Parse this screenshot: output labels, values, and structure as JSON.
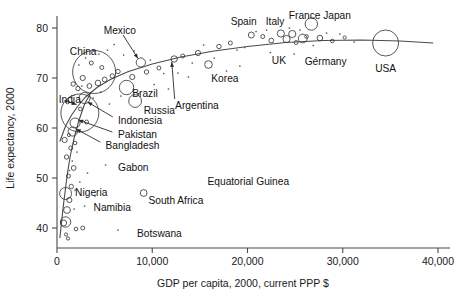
{
  "chart_data": {
    "type": "scatter",
    "title": "",
    "xlabel": "GDP per capita, 2000, current PPP $",
    "ylabel": "Life expectancy, 2000",
    "xlim": [
      0,
      40000
    ],
    "ylim": [
      36,
      83
    ],
    "grid": false,
    "legend": "none",
    "bubble_encoding": "population",
    "xticks": [
      {
        "value": 0,
        "label": "0"
      },
      {
        "value": 10000,
        "label": "10,000"
      },
      {
        "value": 20000,
        "label": "20,000"
      },
      {
        "value": 30000,
        "label": "30,000"
      },
      {
        "value": 40000,
        "label": "40,000"
      }
    ],
    "yticks": [
      {
        "value": 40,
        "label": "40"
      },
      {
        "value": 50,
        "label": "50"
      },
      {
        "value": 60,
        "label": "60"
      },
      {
        "value": 70,
        "label": "70"
      },
      {
        "value": 80,
        "label": "80"
      }
    ],
    "annotations": [
      {
        "name": "China",
        "x": 3900,
        "y": 71.2,
        "label_x": 1350,
        "label_y": 75.4,
        "anchor": "start",
        "leader": false
      },
      {
        "name": "India",
        "x": 2400,
        "y": 63.0,
        "label_x": 180,
        "label_y": 65.8,
        "anchor": "start",
        "leader": true,
        "leader_to_x": 2050,
        "leader_to_y": 64.7
      },
      {
        "name": "Mexico",
        "x": 8800,
        "y": 73.1,
        "label_x": 6600,
        "label_y": 79.6,
        "anchor": "middle",
        "leader": true,
        "leader_to_x": 8500,
        "leader_to_y": 73.9
      },
      {
        "name": "Brazil",
        "x": 7300,
        "y": 68.1,
        "label_x": 7900,
        "label_y": 67.0,
        "anchor": "start",
        "leader": false
      },
      {
        "name": "Russia",
        "x": 8200,
        "y": 65.4,
        "label_x": 9100,
        "label_y": 63.6,
        "anchor": "start",
        "leader": false
      },
      {
        "name": "Indonesia",
        "x": 2900,
        "y": 66.0,
        "label_x": 6400,
        "label_y": 61.6,
        "anchor": "start",
        "leader": true,
        "leader_to_x": 3200,
        "leader_to_y": 65.2
      },
      {
        "name": "Pakistan",
        "x": 1900,
        "y": 61.0,
        "label_x": 6400,
        "label_y": 58.8,
        "anchor": "start",
        "leader": true,
        "leader_to_x": 2250,
        "leader_to_y": 61.6
      },
      {
        "name": "Bangladesh",
        "x": 1650,
        "y": 59.3,
        "label_x": 5100,
        "label_y": 56.6,
        "anchor": "start",
        "leader": true,
        "leader_to_x": 2000,
        "leader_to_y": 59.8
      },
      {
        "name": "Argentina",
        "x": 12300,
        "y": 73.8,
        "label_x": 12400,
        "label_y": 64.6,
        "anchor": "start",
        "leader": true,
        "leader_to_x": 12050,
        "leader_to_y": 73.2
      },
      {
        "name": "Korea",
        "x": 15900,
        "y": 72.7,
        "label_x": 16200,
        "label_y": 70.0,
        "anchor": "start",
        "leader": false
      },
      {
        "name": "Spain",
        "x": 20400,
        "y": 78.6,
        "label_x": 19600,
        "label_y": 81.4,
        "anchor": "middle",
        "leader": false
      },
      {
        "name": "Italy",
        "x": 23500,
        "y": 78.9,
        "label_x": 22900,
        "label_y": 81.4,
        "anchor": "middle",
        "leader": false
      },
      {
        "name": "France",
        "x": 24700,
        "y": 78.8,
        "label_x": 26000,
        "label_y": 82.6,
        "anchor": "middle",
        "leader": false
      },
      {
        "name": "Japan",
        "x": 26700,
        "y": 80.8,
        "label_x": 29400,
        "label_y": 82.6,
        "anchor": "middle",
        "leader": false
      },
      {
        "name": "UK",
        "x": 24100,
        "y": 77.8,
        "label_x": 23300,
        "label_y": 73.6,
        "anchor": "middle",
        "leader": false
      },
      {
        "name": "Germany",
        "x": 25800,
        "y": 77.9,
        "label_x": 28200,
        "label_y": 73.3,
        "anchor": "middle",
        "leader": false
      },
      {
        "name": "USA",
        "x": 34500,
        "y": 77.0,
        "label_x": 34500,
        "label_y": 72.0,
        "anchor": "middle",
        "leader": false
      },
      {
        "name": "Gabon",
        "x": 5800,
        "y": 52.6,
        "label_x": 6400,
        "label_y": 52.2,
        "anchor": "start",
        "leader": false
      },
      {
        "name": "Nigeria",
        "x": 900,
        "y": 46.9,
        "label_x": 1900,
        "label_y": 47.1,
        "anchor": "start",
        "leader": false
      },
      {
        "name": "Namibia",
        "x": 6200,
        "y": 46.0,
        "label_x": 5800,
        "label_y": 44.1,
        "anchor": "middle",
        "leader": false
      },
      {
        "name": "South Africa",
        "x": 9100,
        "y": 47.0,
        "label_x": 9600,
        "label_y": 45.6,
        "anchor": "start",
        "leader": false
      },
      {
        "name": "Equatorial Guinea",
        "x": 15200,
        "y": 49.5,
        "label_x": 15800,
        "label_y": 49.3,
        "anchor": "start",
        "leader": false
      },
      {
        "name": "Botswana",
        "x": 7700,
        "y": 39.4,
        "label_x": 8400,
        "label_y": 38.9,
        "anchor": "start",
        "leader": false
      }
    ],
    "labeled_bubbles": [
      {
        "name": "China",
        "x": 3900,
        "y": 71.2,
        "r": 21.5
      },
      {
        "name": "India",
        "x": 2400,
        "y": 63.0,
        "r": 19.0
      },
      {
        "name": "Mexico",
        "x": 8800,
        "y": 73.1,
        "r": 4.6
      },
      {
        "name": "Brazil",
        "x": 7300,
        "y": 68.1,
        "r": 7.2
      },
      {
        "name": "Russia",
        "x": 8200,
        "y": 65.4,
        "r": 6.4
      },
      {
        "name": "Indonesia",
        "x": 2900,
        "y": 66.0,
        "r": 5.6
      },
      {
        "name": "Pakistan",
        "x": 1900,
        "y": 61.0,
        "r": 5.0
      },
      {
        "name": "Bangladesh",
        "x": 1650,
        "y": 59.3,
        "r": 4.6
      },
      {
        "name": "Japan",
        "x": 26700,
        "y": 80.8,
        "r": 6.2
      },
      {
        "name": "USA",
        "x": 34500,
        "y": 77.0,
        "r": 13.0
      },
      {
        "name": "Germany",
        "x": 25800,
        "y": 77.9,
        "r": 4.4
      },
      {
        "name": "UK",
        "x": 24100,
        "y": 77.8,
        "r": 3.6
      },
      {
        "name": "France",
        "x": 24700,
        "y": 78.8,
        "r": 3.6
      },
      {
        "name": "Italy",
        "x": 23500,
        "y": 78.9,
        "r": 3.6
      },
      {
        "name": "Spain",
        "x": 20400,
        "y": 78.6,
        "r": 3.0
      },
      {
        "name": "Korea",
        "x": 15900,
        "y": 72.7,
        "r": 3.8
      },
      {
        "name": "Argentina",
        "x": 12300,
        "y": 73.8,
        "r": 3.2
      },
      {
        "name": "South Africa",
        "x": 9100,
        "y": 47.0,
        "r": 3.4
      },
      {
        "name": "Nigeria",
        "x": 900,
        "y": 46.9,
        "r": 6.0
      }
    ],
    "other_bubbles": [
      {
        "x": 900,
        "y": 41.2,
        "r": 5.2
      },
      {
        "x": 1050,
        "y": 43.6,
        "r": 3.4
      },
      {
        "x": 1300,
        "y": 45.6,
        "r": 2.6
      },
      {
        "x": 700,
        "y": 41.0,
        "r": 3.0
      },
      {
        "x": 1500,
        "y": 48.3,
        "r": 2.2
      },
      {
        "x": 1200,
        "y": 50.4,
        "r": 2.0
      },
      {
        "x": 1750,
        "y": 52.0,
        "r": 2.4
      },
      {
        "x": 1000,
        "y": 54.2,
        "r": 2.2
      },
      {
        "x": 1450,
        "y": 56.0,
        "r": 2.0
      },
      {
        "x": 800,
        "y": 57.6,
        "r": 2.6
      },
      {
        "x": 1900,
        "y": 57.0,
        "r": 1.8
      },
      {
        "x": 1250,
        "y": 58.6,
        "r": 1.6
      },
      {
        "x": 3100,
        "y": 61.2,
        "r": 2.0
      },
      {
        "x": 2200,
        "y": 67.9,
        "r": 2.2
      },
      {
        "x": 3400,
        "y": 68.4,
        "r": 2.4
      },
      {
        "x": 4300,
        "y": 69.0,
        "r": 2.8
      },
      {
        "x": 5000,
        "y": 69.7,
        "r": 2.4
      },
      {
        "x": 5800,
        "y": 70.4,
        "r": 2.2
      },
      {
        "x": 4700,
        "y": 72.1,
        "r": 2.0
      },
      {
        "x": 6400,
        "y": 71.3,
        "r": 2.2
      },
      {
        "x": 3600,
        "y": 73.0,
        "r": 2.0
      },
      {
        "x": 2700,
        "y": 70.0,
        "r": 2.6
      },
      {
        "x": 1700,
        "y": 68.8,
        "r": 2.2
      },
      {
        "x": 1100,
        "y": 65.2,
        "r": 1.8
      },
      {
        "x": 2450,
        "y": 63.8,
        "r": 1.8
      },
      {
        "x": 7900,
        "y": 70.2,
        "r": 2.6
      },
      {
        "x": 9400,
        "y": 71.2,
        "r": 2.2
      },
      {
        "x": 10700,
        "y": 72.0,
        "r": 2.0
      },
      {
        "x": 13200,
        "y": 74.4,
        "r": 2.0
      },
      {
        "x": 14800,
        "y": 75.0,
        "r": 2.6
      },
      {
        "x": 18200,
        "y": 77.0,
        "r": 2.0
      },
      {
        "x": 17000,
        "y": 76.3,
        "r": 2.2
      },
      {
        "x": 21600,
        "y": 78.3,
        "r": 2.0
      },
      {
        "x": 22500,
        "y": 77.5,
        "r": 2.4
      },
      {
        "x": 25100,
        "y": 77.1,
        "r": 2.0
      },
      {
        "x": 26200,
        "y": 78.3,
        "r": 1.8
      },
      {
        "x": 27600,
        "y": 78.0,
        "r": 2.8
      },
      {
        "x": 28900,
        "y": 77.4,
        "r": 1.8
      },
      {
        "x": 30200,
        "y": 78.1,
        "r": 1.6
      },
      {
        "x": 2000,
        "y": 39.8,
        "r": 1.8
      },
      {
        "x": 2700,
        "y": 40.0,
        "r": 2.0
      },
      {
        "x": 950,
        "y": 38.7,
        "r": 1.6
      },
      {
        "x": 1150,
        "y": 37.9,
        "r": 1.6
      }
    ],
    "dot_points": [
      {
        "x": 6000,
        "y": 76.7
      },
      {
        "x": 5300,
        "y": 75.6
      },
      {
        "x": 4400,
        "y": 74.8
      },
      {
        "x": 3000,
        "y": 74.0
      },
      {
        "x": 2300,
        "y": 72.6
      },
      {
        "x": 7000,
        "y": 74.6
      },
      {
        "x": 8100,
        "y": 75.4
      },
      {
        "x": 9800,
        "y": 73.6
      },
      {
        "x": 11200,
        "y": 70.9
      },
      {
        "x": 12700,
        "y": 71.0
      },
      {
        "x": 15400,
        "y": 76.6
      },
      {
        "x": 16500,
        "y": 74.0
      },
      {
        "x": 18900,
        "y": 75.6
      },
      {
        "x": 19700,
        "y": 76.1
      },
      {
        "x": 20900,
        "y": 79.3
      },
      {
        "x": 22000,
        "y": 79.6
      },
      {
        "x": 24400,
        "y": 80.0
      },
      {
        "x": 25500,
        "y": 79.6
      },
      {
        "x": 26900,
        "y": 76.5
      },
      {
        "x": 28300,
        "y": 79.0
      },
      {
        "x": 29700,
        "y": 78.8
      },
      {
        "x": 24900,
        "y": 74.8
      },
      {
        "x": 27200,
        "y": 74.1
      },
      {
        "x": 22400,
        "y": 75.1
      },
      {
        "x": 17800,
        "y": 71.4
      },
      {
        "x": 19200,
        "y": 72.4
      },
      {
        "x": 13800,
        "y": 70.2
      },
      {
        "x": 11700,
        "y": 67.8
      },
      {
        "x": 10200,
        "y": 68.7
      },
      {
        "x": 8600,
        "y": 66.9
      },
      {
        "x": 6700,
        "y": 66.4
      },
      {
        "x": 5500,
        "y": 64.8
      },
      {
        "x": 4600,
        "y": 67.2
      },
      {
        "x": 3800,
        "y": 66.0
      },
      {
        "x": 2600,
        "y": 68.4
      },
      {
        "x": 5100,
        "y": 52.6
      },
      {
        "x": 3200,
        "y": 51.0
      },
      {
        "x": 2400,
        "y": 49.2
      },
      {
        "x": 4000,
        "y": 46.4
      },
      {
        "x": 2900,
        "y": 44.4
      },
      {
        "x": 1800,
        "y": 43.8
      },
      {
        "x": 6400,
        "y": 39.6
      },
      {
        "x": 1600,
        "y": 53.4
      },
      {
        "x": 1300,
        "y": 51.5
      },
      {
        "x": 2100,
        "y": 55.2
      },
      {
        "x": 1900,
        "y": 47.6
      },
      {
        "x": 14200,
        "y": 73.0
      },
      {
        "x": 31200,
        "y": 77.2
      }
    ],
    "trend_line": [
      {
        "x": 300,
        "y": 57.3
      },
      {
        "x": 900,
        "y": 60.4
      },
      {
        "x": 1500,
        "y": 62.5
      },
      {
        "x": 2200,
        "y": 64.4
      },
      {
        "x": 3000,
        "y": 66.2
      },
      {
        "x": 4200,
        "y": 68.1
      },
      {
        "x": 5600,
        "y": 69.7
      },
      {
        "x": 7500,
        "y": 71.3
      },
      {
        "x": 10000,
        "y": 72.8
      },
      {
        "x": 13000,
        "y": 74.2
      },
      {
        "x": 16500,
        "y": 75.4
      },
      {
        "x": 20000,
        "y": 76.3
      },
      {
        "x": 24000,
        "y": 77.1
      },
      {
        "x": 28000,
        "y": 77.5
      },
      {
        "x": 32000,
        "y": 77.6
      },
      {
        "x": 36000,
        "y": 77.4
      },
      {
        "x": 39500,
        "y": 77.0
      }
    ],
    "trend_line_lower": [
      {
        "x": 300,
        "y": 38.0
      },
      {
        "x": 500,
        "y": 41.5
      },
      {
        "x": 700,
        "y": 45.0
      },
      {
        "x": 900,
        "y": 48.0
      },
      {
        "x": 1100,
        "y": 51.0
      },
      {
        "x": 1400,
        "y": 54.5
      },
      {
        "x": 1800,
        "y": 58.0
      },
      {
        "x": 2300,
        "y": 61.5
      },
      {
        "x": 2900,
        "y": 64.8
      },
      {
        "x": 3600,
        "y": 67.2
      }
    ]
  }
}
